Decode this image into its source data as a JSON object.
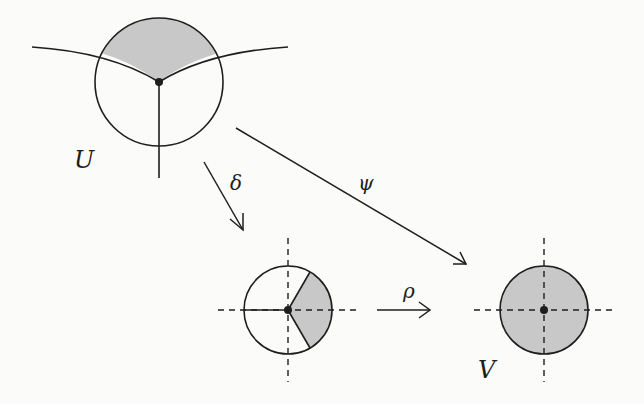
{
  "diagram": {
    "colors": {
      "stroke": "#1e1e1e",
      "shade": "#c8c8c8",
      "background": "#fbfbfa"
    },
    "labels": {
      "U": "U",
      "V": "V",
      "delta": "δ",
      "psi": "ψ",
      "rho": "ρ"
    },
    "nodes": [
      {
        "id": "U",
        "description": "open disc with three curves meeting at center point; upper sector shaded"
      },
      {
        "id": "delta-image",
        "description": "disc with dashed axes; right wedge shaded"
      },
      {
        "id": "V",
        "description": "fully shaded disc with dashed axes and center point"
      }
    ],
    "arrows": [
      {
        "id": "delta",
        "from": "U",
        "to": "delta-image",
        "label": "δ"
      },
      {
        "id": "psi",
        "from": "U",
        "to": "V",
        "label": "ψ"
      },
      {
        "id": "rho",
        "from": "delta-image",
        "to": "V",
        "label": "ρ"
      }
    ]
  }
}
